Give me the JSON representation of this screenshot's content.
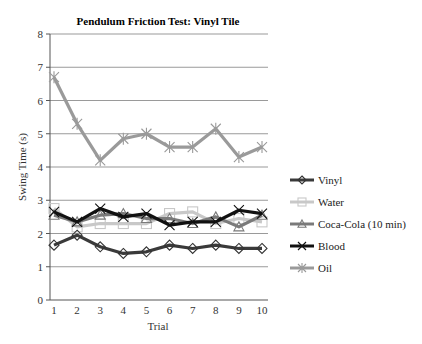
{
  "chart_data": {
    "type": "line",
    "title": "Pendulum Friction Test: Vinyl Tile",
    "xlabel": "Trial",
    "ylabel": "Swing Time (s)",
    "x": [
      1,
      2,
      3,
      4,
      5,
      6,
      7,
      8,
      9,
      10
    ],
    "ylim": [
      0,
      8
    ],
    "yticks": [
      0,
      1,
      2,
      3,
      4,
      5,
      6,
      7,
      8
    ],
    "grid": true,
    "legend_position": "right",
    "series": [
      {
        "name": "Vinyl",
        "marker": "diamond",
        "color": "#3a3a3a",
        "values": [
          1.65,
          1.95,
          1.6,
          1.4,
          1.45,
          1.65,
          1.55,
          1.65,
          1.55,
          1.55
        ]
      },
      {
        "name": "Water",
        "marker": "square",
        "color": "#c8c8c8",
        "values": [
          2.75,
          2.2,
          2.3,
          2.3,
          2.3,
          2.6,
          2.65,
          2.3,
          2.45,
          2.35
        ]
      },
      {
        "name": "Coca-Cola (10 min)",
        "marker": "triangle",
        "color": "#7a7a7a",
        "values": [
          2.55,
          2.35,
          2.55,
          2.6,
          2.45,
          2.45,
          2.3,
          2.5,
          2.2,
          2.55
        ]
      },
      {
        "name": "Blood",
        "marker": "x",
        "color": "#111111",
        "values": [
          2.65,
          2.35,
          2.75,
          2.5,
          2.6,
          2.25,
          2.35,
          2.35,
          2.7,
          2.6
        ]
      },
      {
        "name": "Oil",
        "marker": "star",
        "color": "#9a9a9a",
        "values": [
          6.7,
          5.3,
          4.2,
          4.85,
          5.0,
          4.6,
          4.6,
          5.15,
          4.3,
          4.6
        ]
      }
    ]
  }
}
